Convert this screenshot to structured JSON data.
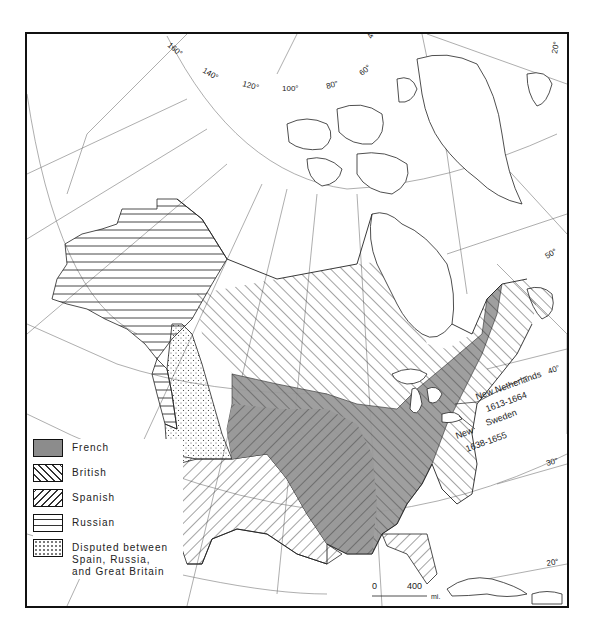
{
  "map": {
    "title": "Colonial North America",
    "legend": [
      {
        "id": "french",
        "label": "French",
        "pattern": "solid-gray",
        "color": "#8c8c8c"
      },
      {
        "id": "british",
        "label": "British",
        "pattern": "diagonal-backslash"
      },
      {
        "id": "spanish",
        "label": "Spanish",
        "pattern": "diagonal-slash"
      },
      {
        "id": "russian",
        "label": "Russian",
        "pattern": "horizontal-lines"
      },
      {
        "id": "disputed",
        "label": "Disputed between Spain, Russia, and Great Britain",
        "pattern": "dotted"
      }
    ],
    "annotations": {
      "new_netherlands": {
        "name": "New Netherlands",
        "years": "1613-1664"
      },
      "new_sweden": {
        "name_line1": "New",
        "name_line2": "Sweden",
        "years": "1638-1655"
      }
    },
    "scale_bar": {
      "start": "0",
      "end": "400",
      "unit": "mi."
    },
    "longitude_labels": [
      "160°",
      "140°",
      "120°",
      "100°",
      "80°",
      "60°",
      "40°",
      "20°"
    ],
    "latitude_labels": [
      "50°",
      "40°",
      "30°",
      "20°"
    ]
  }
}
